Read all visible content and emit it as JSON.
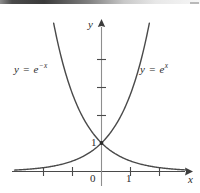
{
  "figure": {
    "background_color": "#ffffff",
    "ink_color": "#3c3c3c",
    "text_color": "#2b2b2b"
  },
  "chart_data": {
    "type": "line",
    "title": "",
    "xlabel": "x",
    "ylabel": "y",
    "xlim": [
      -3.1,
      2.9
    ],
    "ylim": [
      -0.25,
      5.1
    ],
    "grid": false,
    "legend": "inline-curve-labels",
    "axis_style": "arrowed-cartesian-axes",
    "x_ticks": [
      -2,
      -1,
      1,
      2
    ],
    "x_tick_labels": [
      "",
      "",
      "1",
      ""
    ],
    "y_ticks": [
      1,
      2,
      3,
      4
    ],
    "y_tick_labels": [
      "1",
      "",
      "",
      ""
    ],
    "origin_label": "0",
    "marked_points": [
      {
        "x": 0,
        "y": 1,
        "label": "1",
        "style": "dot"
      }
    ],
    "series": [
      {
        "name": "y = e^x",
        "expression": "exp(x)",
        "label": "y = e",
        "label_exponent": "x",
        "color": "#4a4a4a",
        "x": [
          -3,
          -2.5,
          -2,
          -1.5,
          -1,
          -0.5,
          0,
          0.5,
          1,
          1.5,
          1.65
        ],
        "values": [
          0.05,
          0.08,
          0.14,
          0.22,
          0.37,
          0.61,
          1,
          1.65,
          2.72,
          4.48,
          5.2
        ]
      },
      {
        "name": "y = e^-x",
        "expression": "exp(-x)",
        "label": "y = e",
        "label_exponent": "-x",
        "color": "#4a4a4a",
        "x": [
          -1.65,
          -1.5,
          -1,
          -0.5,
          0,
          0.5,
          1,
          1.5,
          2,
          2.5,
          3
        ],
        "values": [
          5.2,
          4.48,
          2.72,
          1.65,
          1,
          0.61,
          0.37,
          0.22,
          0.14,
          0.08,
          0.05
        ]
      }
    ]
  },
  "labels": {
    "curve_left_prefix": "y = e",
    "curve_left_exponent": "−x",
    "curve_right_prefix": "y = e",
    "curve_right_exponent": "x",
    "y_axis": "y",
    "x_axis": "x",
    "origin": "0",
    "x_one": "1",
    "y_one": "1"
  }
}
